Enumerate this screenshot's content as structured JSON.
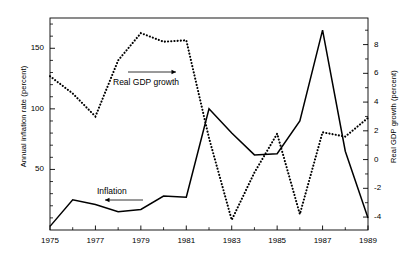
{
  "chart_data": {
    "type": "line",
    "title": "",
    "xlabel": "",
    "ylabel": "Annual inflation rate (percent)",
    "y2label": "Real GDP growth (percent)",
    "x": [
      1975,
      1976,
      1977,
      1978,
      1979,
      1980,
      1981,
      1982,
      1983,
      1984,
      1985,
      1986,
      1987,
      1988,
      1989
    ],
    "xlim": [
      1975,
      1989
    ],
    "xticks": [
      1975,
      1977,
      1979,
      1981,
      1983,
      1985,
      1987,
      1989
    ],
    "xtick_labels": [
      "1975",
      "1977",
      "1979",
      "1981",
      "1983",
      "1985",
      "1987",
      "1989"
    ],
    "xminor_ticks": [
      1976,
      1978,
      1980,
      1982,
      1984,
      1986,
      1988
    ],
    "ylim": [
      0,
      175
    ],
    "yticks": [
      50,
      100,
      150
    ],
    "ytick_labels": [
      "50",
      "100",
      "150"
    ],
    "y2lim": [
      -4.9,
      9.85
    ],
    "y2ticks": [
      8,
      6,
      4,
      2,
      0,
      -2,
      -4
    ],
    "y2tick_labels": [
      "8",
      "6",
      "4",
      "2",
      "0",
      "-2",
      "-4"
    ],
    "grid": false,
    "legend": "annotations",
    "series": [
      {
        "name": "Inflation",
        "axis": "left",
        "style": "solid",
        "color": "#000000",
        "values": [
          3,
          25,
          21,
          15,
          17,
          28,
          27,
          100,
          80,
          62,
          63,
          90,
          165,
          65,
          10
        ]
      },
      {
        "name": "Real GDP growth",
        "axis": "right",
        "style": "dotted",
        "color": "#000000",
        "values": [
          5.8,
          4.6,
          3.0,
          6.9,
          8.8,
          8.2,
          8.3,
          1.5,
          -4.2,
          -0.9,
          1.8,
          -3.8,
          1.9,
          1.6,
          2.9
        ]
      }
    ],
    "annotations": [
      {
        "text": "Real GDP growth",
        "arrow": "right",
        "x": 1979.6,
        "y_axis": "left",
        "y": 118
      },
      {
        "text": "Inflation",
        "arrow": "left",
        "x": 1977.6,
        "y_axis": "left",
        "y": 40
      }
    ]
  },
  "axes": {
    "left_title": "Annual inflation rate (percent)",
    "right_title": "Real GDP growth (percent)"
  },
  "annotations": {
    "gdp_label": "Real GDP growth",
    "inflation_label": "Inflation"
  },
  "colors": {
    "line": "#000000",
    "axis": "#000000",
    "background": "#ffffff"
  }
}
